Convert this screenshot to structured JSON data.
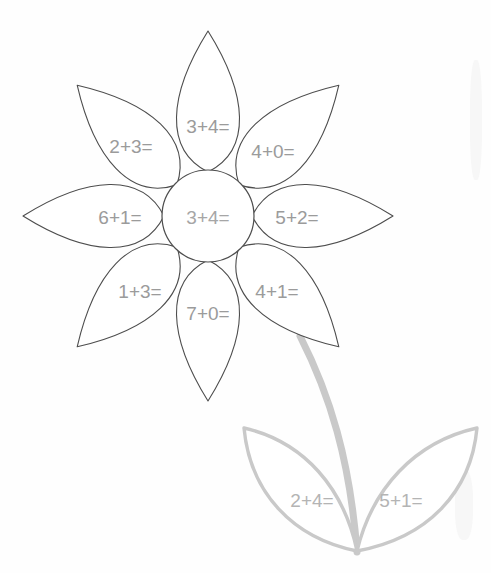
{
  "worksheet": {
    "title": "Flower Addition Worksheet",
    "background_color": "#fefefe",
    "outline_color": "#4d4d4d",
    "leaf_color": "#c9c9c9",
    "text_color": "#9b9b9b"
  },
  "flower": {
    "center": {
      "label": "3+4=",
      "cx": 208,
      "cy": 216,
      "r": 46
    },
    "petals": [
      {
        "name": "petal-top",
        "label": "3+4=",
        "angle": 0,
        "label_x": 208,
        "label_y": 126
      },
      {
        "name": "petal-top-right",
        "label": "4+0=",
        "angle": 45,
        "label_x": 273,
        "label_y": 151
      },
      {
        "name": "petal-right",
        "label": "5+2=",
        "angle": 90,
        "label_x": 297,
        "label_y": 217
      },
      {
        "name": "petal-bottom-right",
        "label": "4+1=",
        "angle": 135,
        "label_x": 277,
        "label_y": 291
      },
      {
        "name": "petal-bottom",
        "label": "7+0=",
        "angle": 180,
        "label_x": 208,
        "label_y": 313
      },
      {
        "name": "petal-bottom-left",
        "label": "1+3=",
        "angle": 225,
        "label_x": 140,
        "label_y": 291
      },
      {
        "name": "petal-left",
        "label": "6+1=",
        "angle": 270,
        "label_x": 120,
        "label_y": 217
      },
      {
        "name": "petal-top-left",
        "label": "2+3=",
        "angle": 315,
        "label_x": 131,
        "label_y": 146
      }
    ]
  },
  "leaves": [
    {
      "name": "leaf-left",
      "label": "2+4=",
      "label_x": 312,
      "label_y": 500
    },
    {
      "name": "leaf-right",
      "label": "5+1=",
      "label_x": 401,
      "label_y": 500
    }
  ]
}
